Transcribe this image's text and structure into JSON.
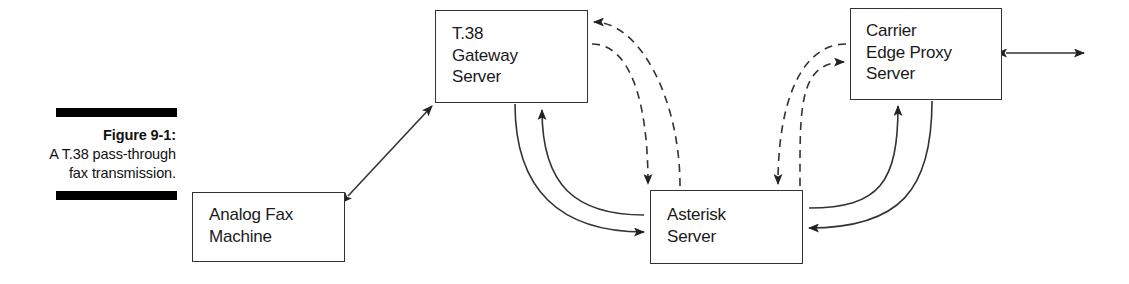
{
  "figure": {
    "caption_label": "Figure 9-1:",
    "caption_body": "A T.38 pass-through fax transmission.",
    "rule_color": "#000000"
  },
  "diagram": {
    "type": "network-flow-diagram",
    "stroke_color": "#333333",
    "background": "#ffffff",
    "nodes": [
      {
        "id": "t38-gateway",
        "label": "T.38\nGateway\nServer"
      },
      {
        "id": "analog-fax",
        "label": "Analog Fax\nMachine"
      },
      {
        "id": "asterisk",
        "label": "Asterisk\nServer"
      },
      {
        "id": "carrier-edge",
        "label": "Carrier\nEdge Proxy\nServer"
      }
    ],
    "edges": [
      {
        "id": "analog-to-t38",
        "from": "analog-fax",
        "to": "t38-gateway",
        "style": "solid",
        "arrows": "double"
      },
      {
        "id": "t38-to-asterisk-a",
        "from": "t38-gateway",
        "to": "asterisk",
        "style": "solid",
        "arrows": "single"
      },
      {
        "id": "asterisk-to-t38-b",
        "from": "asterisk",
        "to": "t38-gateway",
        "style": "solid",
        "arrows": "single"
      },
      {
        "id": "t38-to-asterisk-dash",
        "from": "t38-gateway",
        "to": "asterisk",
        "style": "dashed",
        "arrows": "single"
      },
      {
        "id": "asterisk-to-t38-dash",
        "from": "asterisk",
        "to": "t38-gateway",
        "style": "dashed",
        "arrows": "single"
      },
      {
        "id": "carrier-to-asterisk-dash",
        "from": "carrier-edge",
        "to": "asterisk",
        "style": "dashed",
        "arrows": "single"
      },
      {
        "id": "asterisk-to-carrier-dash",
        "from": "asterisk",
        "to": "carrier-edge",
        "style": "dashed",
        "arrows": "single"
      },
      {
        "id": "carrier-to-asterisk",
        "from": "carrier-edge",
        "to": "asterisk",
        "style": "solid",
        "arrows": "single"
      },
      {
        "id": "asterisk-to-carrier",
        "from": "asterisk",
        "to": "carrier-edge",
        "style": "solid",
        "arrows": "single"
      },
      {
        "id": "carrier-external",
        "from": "carrier-edge",
        "to": "external",
        "style": "solid",
        "arrows": "double"
      }
    ]
  }
}
